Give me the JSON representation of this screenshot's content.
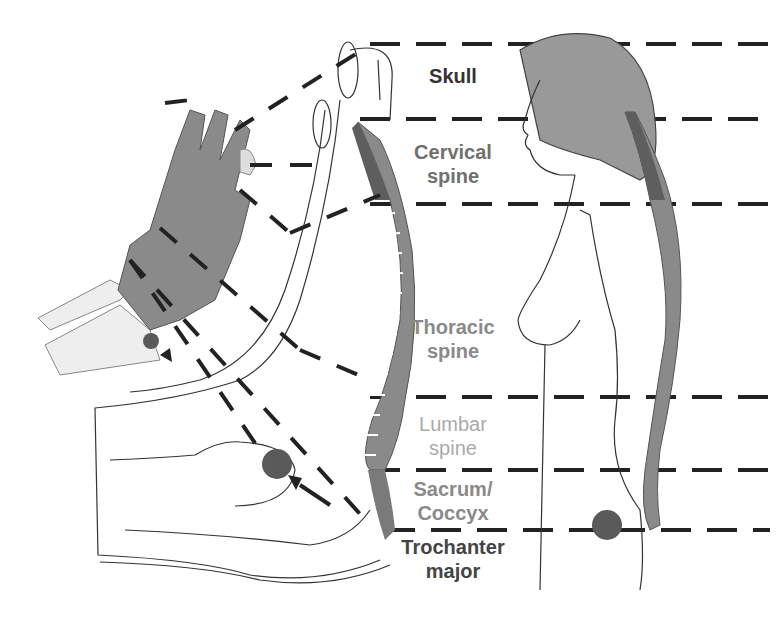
{
  "diagram": {
    "colors": {
      "bone": "#8a8a8a",
      "bone_dark": "#6a6a6a",
      "cervical": "#5e5e5e",
      "disc": "#ffffff",
      "hair": "#999999",
      "dash": "#222222",
      "marker": "#5a5a5a"
    },
    "labels": [
      {
        "id": "skull",
        "text_line1": "Skull",
        "text_line2": "",
        "color": "#333333"
      },
      {
        "id": "cervical",
        "text_line1": "Cervical",
        "text_line2": "spine",
        "color": "#707070"
      },
      {
        "id": "thoracic",
        "text_line1": "Thoracic",
        "text_line2": "spine",
        "color": "#8a8a8a"
      },
      {
        "id": "lumbar",
        "text_line1": "Lumbar",
        "text_line2": "spine",
        "color": "#aaaaaa"
      },
      {
        "id": "sacrum",
        "text_line1": "Sacrum/",
        "text_line2": "Coccyx",
        "color": "#8a8a8a"
      },
      {
        "id": "trochanter",
        "text_line1": "Trochanter",
        "text_line2": "major",
        "color": "#444444"
      }
    ]
  }
}
